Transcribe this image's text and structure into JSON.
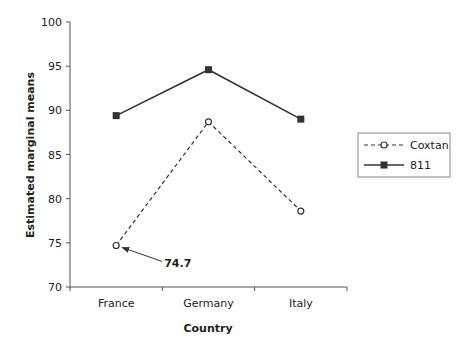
{
  "chart_data": {
    "type": "line",
    "title": "",
    "xlabel": "Country",
    "ylabel": "Estimated marginal means",
    "categories": [
      "France",
      "Germany",
      "Italy"
    ],
    "ylim": [
      70,
      100
    ],
    "yticks": [
      70,
      75,
      80,
      85,
      90,
      95,
      100
    ],
    "grid": false,
    "legend_position": "right",
    "series": [
      {
        "name": "Coxtan",
        "style": "dashed",
        "marker": "open-circle",
        "values": [
          74.7,
          88.7,
          78.6
        ]
      },
      {
        "name": "811",
        "style": "solid",
        "marker": "filled-square",
        "values": [
          89.4,
          94.6,
          89.0
        ]
      }
    ],
    "annotations": [
      {
        "text": "74.7",
        "target_series": "Coxtan",
        "target_category": "France",
        "arrow": true
      }
    ]
  },
  "colors": {
    "line": "#333333",
    "axis": "#555555",
    "legend_border": "#888888"
  }
}
